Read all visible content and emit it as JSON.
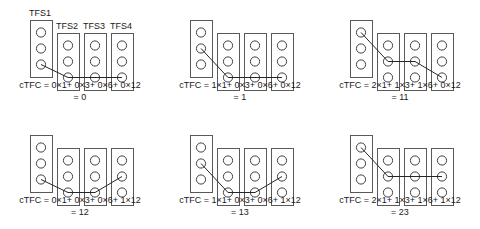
{
  "figure": {
    "columns": [
      "TFS1",
      "TFS2",
      "TFS3",
      "TFS4"
    ],
    "weights": [
      1,
      3,
      6,
      12
    ],
    "colors": {
      "stroke": "#404040",
      "box_stroke": "#595959",
      "line": "#262626",
      "text": "#1a1a1a",
      "background": "#ffffff"
    },
    "show_labels_on_panel": 0,
    "rows_per_column": 3,
    "panels": [
      {
        "id": "panel-1",
        "digits": [
          0,
          0,
          0,
          0
        ],
        "terms": [
          "0×1",
          "0×3",
          "0×6",
          "0×12"
        ],
        "formula": "cTFC = 0×1+ 0×3+ 0×6+ 0×12",
        "result": "= 0",
        "value": 0
      },
      {
        "id": "panel-2",
        "digits": [
          1,
          0,
          0,
          0
        ],
        "terms": [
          "1×1",
          "0×3",
          "0×6",
          "0×12"
        ],
        "formula": "cTFC = 1×1+ 0×3+ 0×6+ 0×12",
        "result": "= 1",
        "value": 1
      },
      {
        "id": "panel-3",
        "digits": [
          2,
          1,
          1,
          0
        ],
        "terms": [
          "2×1",
          "1×3",
          "1×6",
          "0×12"
        ],
        "formula": "cTFC = 2×1+ 1×3+ 1×6+ 0×12",
        "result": "= 11",
        "value": 11
      },
      {
        "id": "panel-4",
        "digits": [
          0,
          0,
          0,
          1
        ],
        "terms": [
          "0×1",
          "0×3",
          "0×6",
          "1×12"
        ],
        "formula": "cTFC = 0×1+ 0×3+ 0×6+ 1×12",
        "result": "= 12",
        "value": 12
      },
      {
        "id": "panel-5",
        "digits": [
          1,
          0,
          0,
          1
        ],
        "terms": [
          "1×1",
          "0×3",
          "0×6",
          "1×12"
        ],
        "formula": "cTFC = 1×1+ 0×3+ 0×6+ 1×12",
        "result": "= 13",
        "value": 13
      },
      {
        "id": "panel-6",
        "digits": [
          2,
          1,
          1,
          1
        ],
        "terms": [
          "2×1",
          "1×3",
          "1×6",
          "1×12"
        ],
        "formula": "cTFC = 2×1+ 1×3+ 1×6+ 1×12",
        "result": "= 23",
        "value": 23
      }
    ]
  }
}
